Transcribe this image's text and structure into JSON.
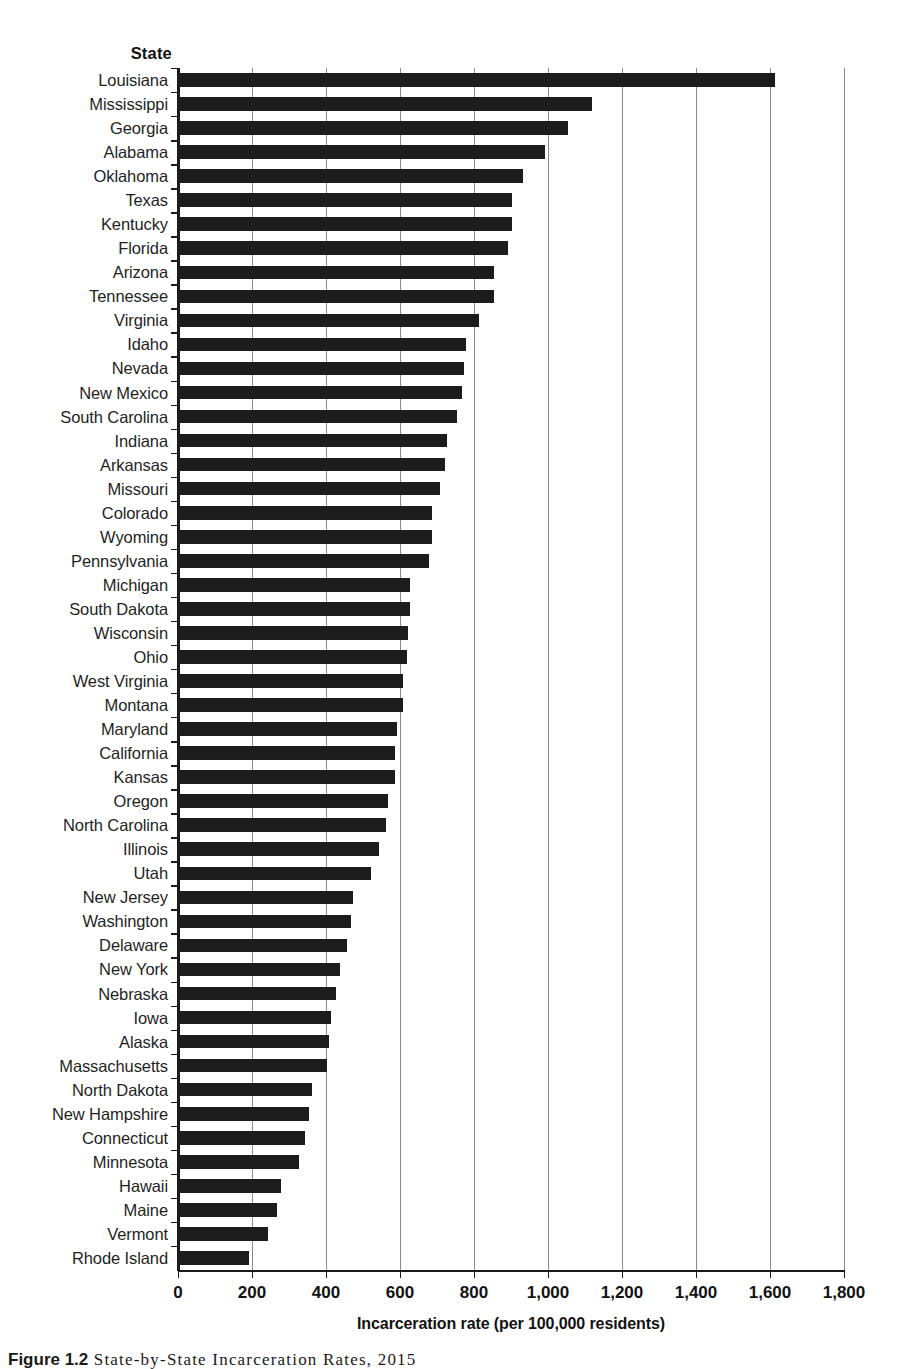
{
  "axis": {
    "y_header": "State",
    "x_title": "Incarceration rate (per 100,000 residents)",
    "x_ticks": [
      "0",
      "200",
      "400",
      "600",
      "800",
      "1,000",
      "1,200",
      "1,400",
      "1,600",
      "1,800"
    ]
  },
  "caption": {
    "number": "Figure 1.2",
    "text": "State-by-State Incarceration Rates, 2015"
  },
  "colors": {
    "bar": "#1c1c1c",
    "grid": "#8a8a8a",
    "axis": "#1a1a1a",
    "background": "#ffffff"
  },
  "chart_data": {
    "type": "bar",
    "orientation": "horizontal",
    "title": "State-by-State Incarceration Rates, 2015",
    "xlabel": "Incarceration rate (per 100,000 residents)",
    "ylabel": "State",
    "xlim": [
      0,
      1800
    ],
    "xticks": [
      0,
      200,
      400,
      600,
      800,
      1000,
      1200,
      1400,
      1600,
      1800
    ],
    "grid": "vertical",
    "legend": "none",
    "categories": [
      "Louisiana",
      "Mississippi",
      "Georgia",
      "Alabama",
      "Oklahoma",
      "Texas",
      "Kentucky",
      "Florida",
      "Arizona",
      "Tennessee",
      "Virginia",
      "Idaho",
      "Nevada",
      "New Mexico",
      "South Carolina",
      "Indiana",
      "Arkansas",
      "Missouri",
      "Colorado",
      "Wyoming",
      "Pennsylvania",
      "Michigan",
      "South Dakota",
      "Wisconsin",
      "Ohio",
      "West Virginia",
      "Montana",
      "Maryland",
      "California",
      "Kansas",
      "Oregon",
      "North Carolina",
      "Illinois",
      "Utah",
      "New Jersey",
      "Washington",
      "Delaware",
      "New York",
      "Nebraska",
      "Iowa",
      "Alaska",
      "Massachusetts",
      "North Dakota",
      "New Hampshire",
      "Connecticut",
      "Minnesota",
      "Hawaii",
      "Maine",
      "Vermont",
      "Rhode Island"
    ],
    "values": [
      1610,
      1115,
      1050,
      990,
      930,
      900,
      900,
      890,
      850,
      850,
      810,
      775,
      770,
      765,
      750,
      725,
      720,
      705,
      685,
      685,
      675,
      625,
      625,
      620,
      615,
      605,
      605,
      590,
      585,
      585,
      565,
      560,
      540,
      520,
      470,
      465,
      455,
      435,
      425,
      410,
      405,
      400,
      360,
      350,
      340,
      325,
      275,
      265,
      240,
      190
    ]
  }
}
